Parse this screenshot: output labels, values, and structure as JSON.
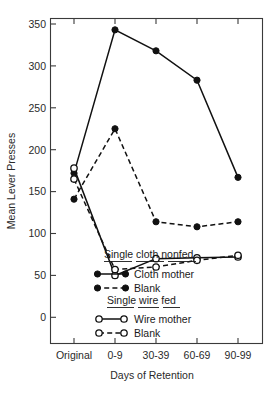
{
  "chart_data": {
    "type": "line",
    "title": "",
    "xlabel": "Days of Retention",
    "ylabel": "Mean Lever Presses",
    "categories": [
      "Original",
      "0-9",
      "30-39",
      "60-69",
      "90-99"
    ],
    "ylim": [
      0,
      360
    ],
    "yticks": [
      0,
      50,
      100,
      150,
      200,
      250,
      300,
      350
    ],
    "ytick_labels": [
      "0",
      "50",
      "100",
      "150",
      "200",
      "250",
      "300",
      "350"
    ],
    "grid": false,
    "legend_position": "inside-lower-center",
    "series": [
      {
        "name": "Cloth mother",
        "group": "Single cloth nonfed",
        "marker": "filled-circle",
        "line": "solid",
        "values": [
          172,
          343,
          318,
          283,
          167
        ]
      },
      {
        "name": "Blank",
        "group": "Single cloth nonfed",
        "marker": "filled-circle",
        "line": "dashed",
        "values": [
          141,
          225,
          114,
          108,
          114
        ]
      },
      {
        "name": "Wire mother",
        "group": "Single wire fed",
        "marker": "open-circle",
        "line": "solid",
        "values": [
          178,
          50,
          70,
          71,
          72
        ]
      },
      {
        "name": "Blank",
        "group": "Single wire fed",
        "marker": "open-circle",
        "line": "dashed",
        "values": [
          165,
          57,
          60,
          68,
          74
        ]
      }
    ]
  },
  "legend": {
    "group_cloth_heading": "Single cloth nonfed",
    "cloth_mother_label": "Cloth mother",
    "cloth_blank_label": "Blank",
    "group_wire_heading": "Single wire fed",
    "wire_mother_label": "Wire mother",
    "wire_blank_label": "Blank"
  },
  "axes": {
    "y_title": "Mean Lever Presses",
    "x_title": "Days of Retention",
    "y_tick_0": "0",
    "y_tick_50": "50",
    "y_tick_100": "100",
    "y_tick_150": "150",
    "y_tick_200": "200",
    "y_tick_250": "250",
    "y_tick_300": "300",
    "y_tick_350": "350",
    "x_tick_1": "Original",
    "x_tick_2": "0-9",
    "x_tick_3": "30-39",
    "x_tick_4": "60-69",
    "x_tick_5": "90-99"
  }
}
